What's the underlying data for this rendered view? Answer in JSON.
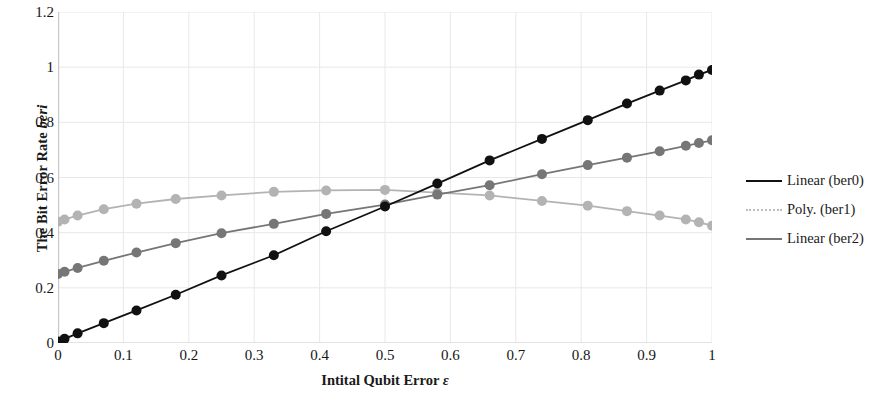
{
  "chart_data": {
    "type": "scatter",
    "title": "",
    "xlabel": "Intital Qubit Error ε",
    "ylabel": "The Bit Error Rate beri",
    "xlabel_parts": {
      "text": "Intital Qubit Error ",
      "symbol": "ε"
    },
    "ylabel_parts": {
      "text": "The Bit Error Rate ",
      "symbol": "beri"
    },
    "xlim": [
      0,
      1
    ],
    "ylim": [
      0,
      1.2
    ],
    "xticks": [
      "0",
      "0.1",
      "0.2",
      "0.3",
      "0.4",
      "0.5",
      "0.6",
      "0.7",
      "0.8",
      "0.9",
      "1"
    ],
    "xtick_values": [
      0,
      0.1,
      0.2,
      0.3,
      0.4,
      0.5,
      0.6,
      0.7,
      0.8,
      0.9,
      1
    ],
    "yticks": [
      "0",
      "0.2",
      "0.4",
      "0.6",
      "0.8",
      "1",
      "1.2"
    ],
    "ytick_values": [
      0,
      0.2,
      0.4,
      0.6,
      0.8,
      1,
      1.2
    ],
    "grid": {
      "vertical": true,
      "horizontal": true,
      "color": "#e8e8e8"
    },
    "legend_position": "right",
    "markers": {
      "shape": "circle",
      "radius": 5
    },
    "series": [
      {
        "name": "Linear (ber0)",
        "legend_label": "Linear (ber0)",
        "color": "#111111",
        "line_style": "solid",
        "x": [
          0,
          0.01,
          0.03,
          0.07,
          0.12,
          0.18,
          0.25,
          0.33,
          0.41,
          0.5,
          0.58,
          0.66,
          0.74,
          0.81,
          0.87,
          0.92,
          0.96,
          0.98,
          1
        ],
        "y": [
          0.005,
          0.015,
          0.035,
          0.072,
          0.118,
          0.175,
          0.245,
          0.318,
          0.405,
          0.495,
          0.578,
          0.662,
          0.74,
          0.808,
          0.868,
          0.915,
          0.952,
          0.973,
          0.99
        ]
      },
      {
        "name": "Poly. (ber1)",
        "legend_label": "Poly. (ber1)",
        "color": "#b3b3b3",
        "line_style": "solid",
        "x": [
          0,
          0.01,
          0.03,
          0.07,
          0.12,
          0.18,
          0.25,
          0.33,
          0.41,
          0.5,
          0.58,
          0.66,
          0.74,
          0.81,
          0.87,
          0.92,
          0.96,
          0.98,
          1
        ],
        "y": [
          0.44,
          0.448,
          0.462,
          0.485,
          0.505,
          0.522,
          0.535,
          0.548,
          0.553,
          0.555,
          0.545,
          0.535,
          0.515,
          0.498,
          0.478,
          0.462,
          0.448,
          0.438,
          0.425
        ]
      },
      {
        "name": "Linear (ber2)",
        "legend_label": "Linear (ber2)",
        "color": "#767676",
        "line_style": "solid",
        "x": [
          0,
          0.01,
          0.03,
          0.07,
          0.12,
          0.18,
          0.25,
          0.33,
          0.41,
          0.5,
          0.58,
          0.66,
          0.74,
          0.81,
          0.87,
          0.92,
          0.96,
          0.98,
          1
        ],
        "y": [
          0.25,
          0.258,
          0.272,
          0.298,
          0.328,
          0.362,
          0.398,
          0.432,
          0.468,
          0.502,
          0.538,
          0.572,
          0.612,
          0.645,
          0.672,
          0.695,
          0.715,
          0.725,
          0.735
        ]
      }
    ]
  },
  "legend": {
    "items": [
      {
        "label": "Linear (ber0)",
        "color": "#111111"
      },
      {
        "label": "Poly. (ber1)",
        "color": "#bdbdbd"
      },
      {
        "label": "Linear (ber2)",
        "color": "#767676"
      }
    ]
  }
}
